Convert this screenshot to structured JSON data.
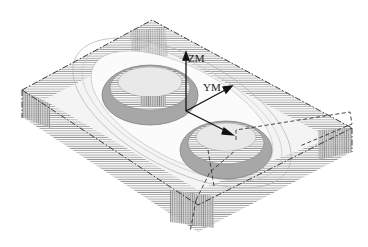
{
  "diagram": {
    "type": "isometric-toolpath",
    "labels": {
      "zm": "ZM",
      "ym": "YM"
    },
    "colors": {
      "background": "#ffffff",
      "toolpath": "#8a8a8a",
      "toolpath_dark": "#5e5e5e",
      "outline": "#2a2a2a",
      "axis": "#111111"
    }
  }
}
